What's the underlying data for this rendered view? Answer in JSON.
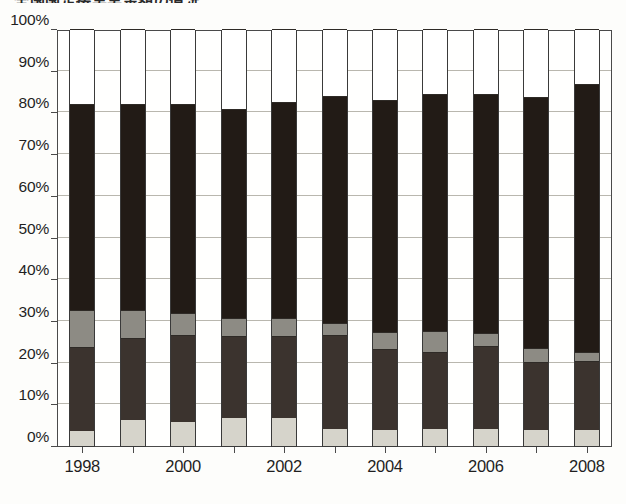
{
  "title": "全国国定接実実金額の情況",
  "chart_data": {
    "type": "bar",
    "stacked": true,
    "normalized": true,
    "title": "全国国定接実実金額の情況",
    "xlabel": "",
    "ylabel": "",
    "ylim": [
      0,
      100
    ],
    "grid": true,
    "legend": "none",
    "y_ticks": [
      "0%",
      "10%",
      "20%",
      "30%",
      "40%",
      "50%",
      "60%",
      "70%",
      "80%",
      "90%",
      "100%"
    ],
    "y_tick_values": [
      0,
      10,
      20,
      30,
      40,
      50,
      60,
      70,
      80,
      90,
      100
    ],
    "categories": [
      "1998",
      "1999",
      "2000",
      "2001",
      "2002",
      "2003",
      "2004",
      "2005",
      "2006",
      "2007",
      "2008"
    ],
    "visible_x_tick_labels": [
      "1998",
      "2000",
      "2002",
      "2004",
      "2006",
      "2008"
    ],
    "series": [
      {
        "name": "segment-1-light-gray",
        "color": "#d6d4cb",
        "values": [
          3.6,
          6.2,
          5.8,
          6.7,
          6.8,
          4.2,
          3.8,
          4.0,
          4.1,
          3.8,
          3.8
        ]
      },
      {
        "name": "segment-2-dark-gray",
        "color": "#3b332e",
        "values": [
          20.2,
          19.6,
          20.9,
          19.8,
          19.5,
          22.4,
          19.4,
          18.6,
          19.9,
          16.4,
          16.6
        ]
      },
      {
        "name": "segment-3-mid-gray",
        "color": "#8d8b84",
        "values": [
          8.8,
          6.7,
          5.1,
          4.1,
          4.5,
          2.9,
          4.2,
          5.1,
          3.1,
          3.2,
          2.1
        ]
      },
      {
        "name": "segment-4-black",
        "color": "#221b16",
        "values": [
          49.4,
          49.5,
          50.2,
          50.2,
          51.7,
          54.5,
          55.6,
          56.7,
          57.2,
          60.3,
          64.4
        ]
      },
      {
        "name": "segment-5-white",
        "color": "#ffffff",
        "values": [
          18.0,
          18.0,
          18.0,
          19.2,
          17.5,
          16.0,
          17.0,
          15.6,
          15.7,
          16.3,
          13.1
        ]
      }
    ],
    "cumulative_tops": {
      "1998": [
        3.6,
        23.8,
        32.6,
        82.0,
        100
      ],
      "1999": [
        6.2,
        25.8,
        32.5,
        82.0,
        100
      ],
      "2000": [
        5.8,
        26.7,
        31.8,
        82.0,
        100
      ],
      "2001": [
        6.7,
        26.5,
        30.6,
        80.8,
        100
      ],
      "2002": [
        6.8,
        26.3,
        30.8,
        82.5,
        100
      ],
      "2003": [
        4.2,
        26.6,
        29.5,
        84.0,
        100
      ],
      "2004": [
        3.8,
        23.2,
        27.4,
        83.0,
        100
      ],
      "2005": [
        4.0,
        22.6,
        27.7,
        84.4,
        100
      ],
      "2006": [
        4.1,
        24.0,
        27.1,
        84.3,
        100
      ],
      "2007": [
        3.8,
        20.2,
        23.4,
        83.7,
        100
      ],
      "2008": [
        3.8,
        20.4,
        22.5,
        86.9,
        100
      ]
    }
  }
}
